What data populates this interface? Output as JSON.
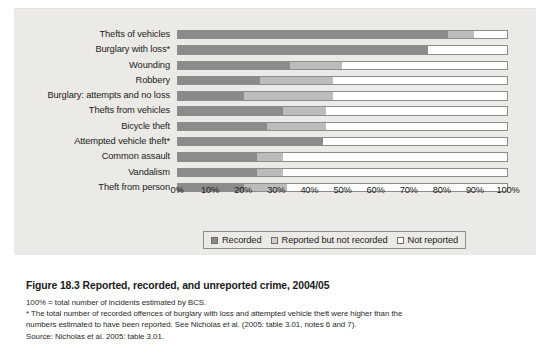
{
  "figure": {
    "number": "Figure 18.3",
    "title": "Reported, recorded, and unreported crime, 2004/05",
    "note_1": "100% = total number of incidents estimated by BCS.",
    "note_2": "* The total number of recorded offences of burglary with loss and attempted vehicle theft were higher than the",
    "note_3": "numbers estimated to have been reported. See Nicholas et al. (2005: table 3.01, notes 6 and 7).",
    "source": "Source: Nicholas et al. 2005: table 3.01."
  },
  "legend": {
    "items": [
      {
        "label": "Recorded",
        "color": "#8b8b8b"
      },
      {
        "label": "Reported but not recorded",
        "color": "#cfcfcf"
      },
      {
        "label": "Not reported",
        "color": "#ffffff"
      }
    ]
  },
  "chart_data": {
    "type": "bar",
    "orientation": "horizontal",
    "stacked": true,
    "title": "Reported, recorded, and unreported crime, 2004/05",
    "xlabel": "",
    "ylabel": "",
    "xlim": [
      0,
      100
    ],
    "xticks": [
      0,
      10,
      20,
      30,
      40,
      50,
      60,
      70,
      80,
      90,
      100
    ],
    "xtick_labels": [
      "0%",
      "10%",
      "20%",
      "30%",
      "40%",
      "50%",
      "60%",
      "70%",
      "80%",
      "90%",
      "100%"
    ],
    "grid": false,
    "legend_position": "bottom",
    "categories": [
      "Thefts of vehicles",
      "Burglary with loss*",
      "Wounding",
      "Robbery",
      "Burglary: attempts and no loss",
      "Thefts from vehicles",
      "Bicycle theft",
      "Attempted vehicle theft*",
      "Common assault",
      "Vandalism",
      "Theft from person"
    ],
    "series": [
      {
        "name": "Recorded",
        "color": "#8b8b8b",
        "values": [
          82,
          76,
          34,
          25,
          20,
          32,
          27,
          44,
          24,
          24,
          20
        ]
      },
      {
        "name": "Reported but not recorded",
        "color": "#bcbcbc",
        "values": [
          8,
          0,
          16,
          22,
          27,
          13,
          18,
          0,
          8,
          8,
          13
        ]
      },
      {
        "name": "Not reported",
        "color": "#ffffff",
        "values": [
          10,
          24,
          50,
          53,
          53,
          55,
          55,
          56,
          68,
          68,
          67
        ]
      }
    ]
  }
}
